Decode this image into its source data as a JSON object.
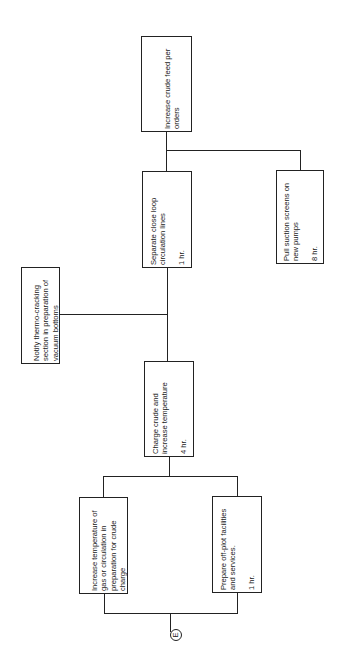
{
  "diagram": {
    "orientation": "rotated-90-ccw",
    "nodes": [
      {
        "id": "increase-feed",
        "label": "Increase crude feed per\norders",
        "duration": ""
      },
      {
        "id": "separate-loop",
        "label": "Separate close loop\ncirculation lines",
        "duration": "1 hr."
      },
      {
        "id": "pull-screens",
        "label": "Pull suction screens on\nnew pumps",
        "duration": "8 hr."
      },
      {
        "id": "notify-thermo",
        "label": "Notify thermo-cracking\nsection in preparation of\nvacuum bottoms",
        "duration": ""
      },
      {
        "id": "charge-crude",
        "label": "Charge crude and\nincrease temperature",
        "duration": "4 hr."
      },
      {
        "id": "increase-temp-gas",
        "label": "Increase temperature of\ngas or circulation in\npreparation for crude\ncharge",
        "duration": ""
      },
      {
        "id": "prepare-offplot",
        "label": "Prepare off-plot facilities\nand services.",
        "duration": "1 hr."
      }
    ],
    "connector": {
      "label": "E"
    },
    "edges": [
      [
        "increase-temp-gas",
        "charge-crude"
      ],
      [
        "prepare-offplot",
        "charge-crude"
      ],
      [
        "charge-crude",
        "separate-loop"
      ],
      [
        "charge-crude",
        "notify-thermo"
      ],
      [
        "separate-loop",
        "increase-feed"
      ],
      [
        "pull-screens",
        "increase-feed"
      ],
      [
        "connector-E",
        "increase-temp-gas"
      ],
      [
        "connector-E",
        "prepare-offplot"
      ]
    ]
  }
}
